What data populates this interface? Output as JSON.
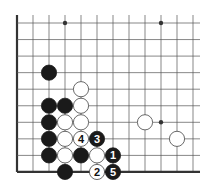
{
  "diagram": {
    "type": "go-board-diagram",
    "grid": {
      "columns": 12,
      "rows": 10,
      "origin_x": 17,
      "origin_y": 23,
      "spacing_x": 16,
      "spacing_y": 16.55,
      "line_end_x": 200,
      "line_start_y": 15,
      "edges": [
        "left",
        "bottom"
      ]
    },
    "colors": {
      "line": "#555555",
      "edge": "#333333",
      "black_stone": "#1a1a1a",
      "white_stone": "#ffffff",
      "white_stone_border": "#444444"
    },
    "star_points": [
      {
        "col": 3,
        "row": 0
      },
      {
        "col": 9,
        "row": 0
      },
      {
        "col": 9,
        "row": 6
      }
    ],
    "stones": [
      {
        "color": "black",
        "col": 2,
        "row": 3,
        "label": ""
      },
      {
        "color": "white",
        "col": 4,
        "row": 4,
        "label": ""
      },
      {
        "color": "black",
        "col": 2,
        "row": 5,
        "label": ""
      },
      {
        "color": "black",
        "col": 3,
        "row": 5,
        "label": ""
      },
      {
        "color": "white",
        "col": 4,
        "row": 5,
        "label": ""
      },
      {
        "color": "black",
        "col": 2,
        "row": 6,
        "label": ""
      },
      {
        "color": "white",
        "col": 3,
        "row": 6,
        "label": ""
      },
      {
        "color": "white",
        "col": 4,
        "row": 6,
        "label": ""
      },
      {
        "color": "white",
        "col": 8,
        "row": 6,
        "label": ""
      },
      {
        "color": "black",
        "col": 2,
        "row": 7,
        "label": ""
      },
      {
        "color": "white",
        "col": 3,
        "row": 7,
        "label": ""
      },
      {
        "color": "white",
        "col": 4,
        "row": 7,
        "label": "4"
      },
      {
        "color": "black",
        "col": 5,
        "row": 7,
        "label": "3"
      },
      {
        "color": "white",
        "col": 10,
        "row": 7,
        "label": ""
      },
      {
        "color": "black",
        "col": 2,
        "row": 8,
        "label": ""
      },
      {
        "color": "white",
        "col": 3,
        "row": 8,
        "label": ""
      },
      {
        "color": "black",
        "col": 4,
        "row": 8,
        "label": ""
      },
      {
        "color": "white",
        "col": 5,
        "row": 8,
        "label": ""
      },
      {
        "color": "black",
        "col": 6,
        "row": 8,
        "label": "1"
      },
      {
        "color": "black",
        "col": 3,
        "row": 9,
        "label": ""
      },
      {
        "color": "white",
        "col": 5,
        "row": 9,
        "label": "2"
      },
      {
        "color": "black",
        "col": 6,
        "row": 9,
        "label": "5"
      }
    ],
    "move_sequence": [
      "1",
      "2",
      "3",
      "4",
      "5"
    ]
  }
}
